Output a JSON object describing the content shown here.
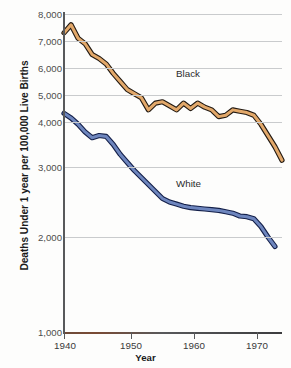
{
  "chart_data": {
    "type": "line",
    "title": "",
    "subtitle": "",
    "xlabel": "Year",
    "ylabel": "Deaths Under 1 year per 100,000 Live Births",
    "xlim": [
      1940,
      1971
    ],
    "ylim": [
      1000,
      8000
    ],
    "xticks": [
      1940,
      1950,
      1960,
      1970
    ],
    "xticklabels": [
      "1940",
      "1950",
      "1960",
      "1970"
    ],
    "yticks": [
      1000,
      2000,
      3000,
      4000,
      5000,
      6000,
      7000,
      8000
    ],
    "yticklabels": [
      "1,000",
      "2,000",
      "3,000",
      "4,000",
      "5,000",
      "6,000",
      "7,000",
      "8,000"
    ],
    "y_axis_note": "non-linear/compressed spacing: 4,000-8,000 evenly spaced, below 4,000 progressively expanded",
    "grid": true,
    "grid_axis": "y",
    "legend_position": "inline-annotation",
    "annotations": [
      {
        "text": "Black",
        "x": 1958,
        "y": 5250
      },
      {
        "text": "White",
        "x": 1958,
        "y": 2700
      }
    ],
    "series": [
      {
        "name": "Black",
        "color": "#E2A86A",
        "edge_color": "#231a12",
        "x": [
          1940,
          1941,
          1942,
          1943,
          1944,
          1945,
          1946,
          1947,
          1948,
          1949,
          1950,
          1951,
          1952,
          1953,
          1954,
          1955,
          1956,
          1957,
          1958,
          1959,
          1960,
          1961,
          1962,
          1963,
          1964,
          1965,
          1966,
          1967,
          1968,
          1969,
          1970,
          1971
        ],
        "y": [
          7300,
          7600,
          7100,
          6900,
          6500,
          6350,
          6150,
          5800,
          5500,
          5200,
          5050,
          4900,
          4450,
          4700,
          4750,
          4600,
          4450,
          4700,
          4500,
          4700,
          4550,
          4450,
          4200,
          4250,
          4450,
          4400,
          4350,
          4250,
          3950,
          3700,
          3450,
          3150
        ]
      },
      {
        "name": "White",
        "color": "#6E86BE",
        "edge_color": "#14204a",
        "x": [
          1940,
          1941,
          1942,
          1943,
          1944,
          1945,
          1946,
          1947,
          1948,
          1949,
          1950,
          1951,
          1952,
          1953,
          1954,
          1955,
          1956,
          1957,
          1958,
          1959,
          1960,
          1961,
          1962,
          1963,
          1964,
          1965,
          1966,
          1967,
          1968,
          1969,
          1970
        ],
        "y": [
          4320,
          4150,
          3950,
          3780,
          3650,
          3700,
          3680,
          3500,
          3280,
          3100,
          2950,
          2850,
          2750,
          2650,
          2550,
          2500,
          2470,
          2440,
          2420,
          2410,
          2400,
          2390,
          2380,
          2360,
          2340,
          2300,
          2290,
          2260,
          2150,
          2000,
          1900
        ]
      }
    ]
  },
  "axis": {
    "ytick_labels": [
      "8,000",
      "7,000",
      "6,000",
      "5,000",
      "4,000",
      "3,000",
      "2,000",
      "1,000"
    ],
    "xtick_labels": [
      "1940",
      "1950",
      "1960",
      "1970"
    ],
    "x_title": "Year",
    "y_title": "Deaths Under 1 year per 100,000 Live Births"
  },
  "labels": {
    "black": "Black",
    "white": "White"
  },
  "colors": {
    "black_series_fill": "#E2A86A",
    "black_series_edge": "#231a12",
    "white_series_fill": "#6E86BE",
    "white_series_edge": "#14204a",
    "gridline": "#c9cbcd",
    "axis": "#58595b",
    "background": "#fdfdfc"
  }
}
